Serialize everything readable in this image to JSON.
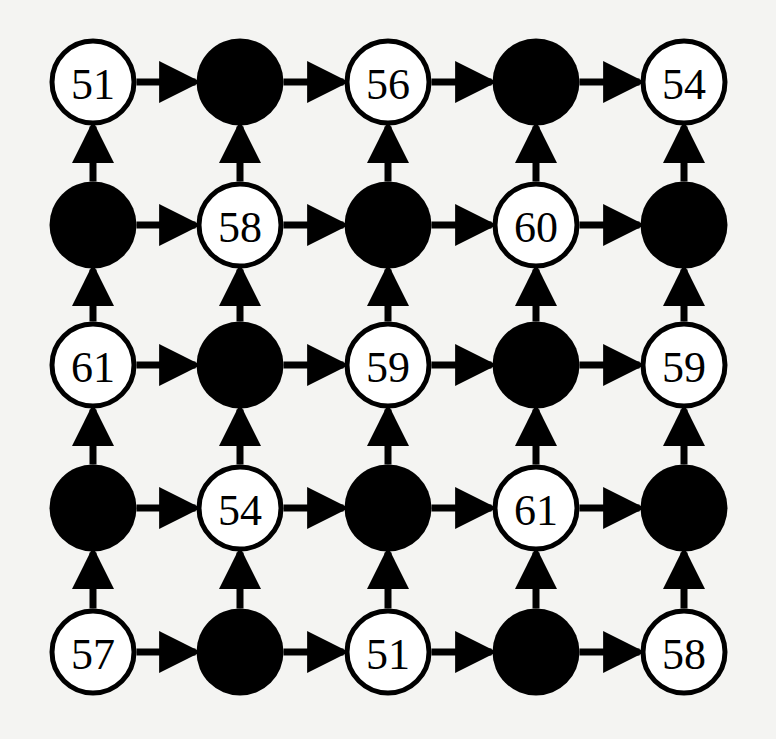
{
  "diagram": {
    "type": "directed-grid-graph",
    "rows": 5,
    "cols": 5,
    "edge_direction": {
      "horizontal": "left-to-right",
      "vertical": "bottom-to-top"
    },
    "colors": {
      "background": "#f4f4f2",
      "ink": "#000000",
      "open_fill": "#ffffff"
    },
    "layout": {
      "col_x": [
        93,
        240,
        388,
        536,
        684
      ],
      "row_y": [
        82,
        225,
        365,
        508,
        652
      ],
      "radius": 41,
      "stroke": 5
    },
    "nodes": [
      [
        {
          "type": "open",
          "label": "51"
        },
        {
          "type": "filled",
          "label": ""
        },
        {
          "type": "open",
          "label": "56"
        },
        {
          "type": "filled",
          "label": ""
        },
        {
          "type": "open",
          "label": "54"
        }
      ],
      [
        {
          "type": "filled",
          "label": ""
        },
        {
          "type": "open",
          "label": "58"
        },
        {
          "type": "filled",
          "label": ""
        },
        {
          "type": "open",
          "label": "60"
        },
        {
          "type": "filled",
          "label": ""
        }
      ],
      [
        {
          "type": "open",
          "label": "61"
        },
        {
          "type": "filled",
          "label": ""
        },
        {
          "type": "open",
          "label": "59"
        },
        {
          "type": "filled",
          "label": ""
        },
        {
          "type": "open",
          "label": "59"
        }
      ],
      [
        {
          "type": "filled",
          "label": ""
        },
        {
          "type": "open",
          "label": "54"
        },
        {
          "type": "filled",
          "label": ""
        },
        {
          "type": "open",
          "label": "61"
        },
        {
          "type": "filled",
          "label": ""
        }
      ],
      [
        {
          "type": "open",
          "label": "57"
        },
        {
          "type": "filled",
          "label": ""
        },
        {
          "type": "open",
          "label": "51"
        },
        {
          "type": "filled",
          "label": ""
        },
        {
          "type": "open",
          "label": "58"
        }
      ]
    ]
  }
}
